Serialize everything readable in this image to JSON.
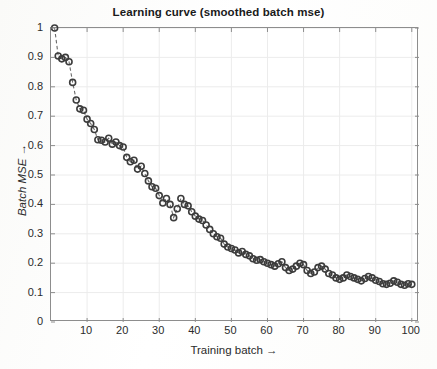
{
  "chart_data": {
    "type": "scatter",
    "title": "Learning curve (smoothed batch mse)",
    "xlabel": "Training batch →",
    "ylabel": "Batch MSE →",
    "xlim": [
      0,
      102
    ],
    "ylim": [
      0,
      1.0
    ],
    "grid": true,
    "legend": "none",
    "marker": "open-circle",
    "line_style": "dashed",
    "marker_color": "#3c3c3c",
    "line_color": "#6a6a6a",
    "grid_color": "#ececec",
    "axis_color": "#8d8d8d",
    "xticks": [
      10,
      20,
      30,
      40,
      50,
      60,
      70,
      80,
      90,
      100
    ],
    "xtick_labels": [
      "10",
      "20",
      "30",
      "40",
      "50",
      "60",
      "70",
      "80",
      "90",
      "100"
    ],
    "yticks": [
      0,
      0.1,
      0.2,
      0.3,
      0.4,
      0.5,
      0.6,
      0.7,
      0.8,
      0.9,
      1
    ],
    "ytick_labels": [
      "0",
      "0.1",
      "0.2",
      "0.3",
      "0.4",
      "0.5",
      "0.6",
      "0.7",
      "0.8",
      "0.9",
      "1"
    ],
    "x": [
      1,
      2,
      3,
      4,
      5,
      6,
      7,
      8,
      9,
      10,
      11,
      12,
      13,
      14,
      15,
      16,
      17,
      18,
      19,
      20,
      21,
      22,
      23,
      24,
      25,
      26,
      27,
      28,
      29,
      30,
      31,
      32,
      33,
      34,
      35,
      36,
      37,
      38,
      39,
      40,
      41,
      42,
      43,
      44,
      45,
      46,
      47,
      48,
      49,
      50,
      51,
      52,
      53,
      54,
      55,
      56,
      57,
      58,
      59,
      60,
      61,
      62,
      63,
      64,
      65,
      66,
      67,
      68,
      69,
      70,
      71,
      72,
      73,
      74,
      75,
      76,
      77,
      78,
      79,
      80,
      81,
      82,
      83,
      84,
      85,
      86,
      87,
      88,
      89,
      90,
      91,
      92,
      93,
      94,
      95,
      96,
      97,
      98,
      99,
      100
    ],
    "y": [
      1.0,
      0.905,
      0.895,
      0.9,
      0.885,
      0.815,
      0.755,
      0.725,
      0.72,
      0.69,
      0.675,
      0.655,
      0.62,
      0.618,
      0.612,
      0.625,
      0.605,
      0.612,
      0.6,
      0.595,
      0.56,
      0.545,
      0.55,
      0.52,
      0.53,
      0.505,
      0.48,
      0.46,
      0.455,
      0.43,
      0.405,
      0.42,
      0.4,
      0.355,
      0.385,
      0.42,
      0.4,
      0.395,
      0.375,
      0.36,
      0.35,
      0.345,
      0.33,
      0.315,
      0.3,
      0.29,
      0.285,
      0.265,
      0.255,
      0.25,
      0.245,
      0.235,
      0.24,
      0.23,
      0.225,
      0.215,
      0.21,
      0.212,
      0.205,
      0.2,
      0.195,
      0.19,
      0.198,
      0.205,
      0.185,
      0.175,
      0.18,
      0.19,
      0.2,
      0.195,
      0.175,
      0.165,
      0.17,
      0.185,
      0.19,
      0.18,
      0.165,
      0.16,
      0.15,
      0.145,
      0.15,
      0.16,
      0.155,
      0.15,
      0.145,
      0.14,
      0.148,
      0.155,
      0.15,
      0.142,
      0.138,
      0.13,
      0.128,
      0.132,
      0.14,
      0.135,
      0.128,
      0.125,
      0.13,
      0.128
    ]
  }
}
